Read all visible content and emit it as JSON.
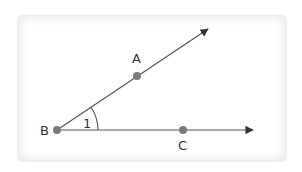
{
  "diagram": {
    "type": "angle",
    "colors": {
      "line": "#555555",
      "point": "#7a7a7a",
      "text": "#333333",
      "card_shadow": "#e6e6e6"
    },
    "points": {
      "A": {
        "label": "A",
        "x": 137,
        "y": 76
      },
      "B": {
        "label": "B",
        "x": 57,
        "y": 130
      },
      "C": {
        "label": "C",
        "x": 183,
        "y": 130
      }
    },
    "rays": [
      {
        "from": "B",
        "through": "A",
        "end": [
          209,
          28
        ]
      },
      {
        "from": "B",
        "through": "C",
        "end": [
          254,
          130
        ]
      }
    ],
    "angle": {
      "vertex": "B",
      "label": "1"
    }
  }
}
